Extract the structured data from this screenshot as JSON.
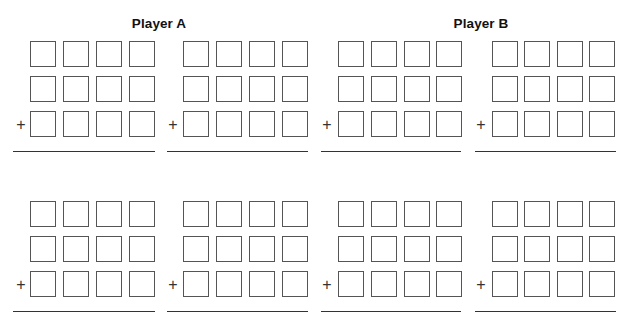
{
  "worksheet": {
    "players": [
      {
        "label": "Player A"
      },
      {
        "label": "Player B"
      }
    ],
    "operator_symbol": "+",
    "digits_per_row": 4,
    "rows_per_problem": 3,
    "problems_per_player_per_section": 2,
    "sections": 2,
    "colors": {
      "box_border": "#555555",
      "line": "#333333",
      "heading": "#111111",
      "background": "#ffffff"
    }
  }
}
